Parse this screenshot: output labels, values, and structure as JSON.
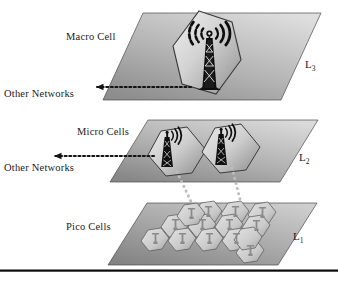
{
  "figure": {
    "type": "layered-network-diagram",
    "background_color": "#ffffff",
    "bottom_rule_color": "#0b0b0b"
  },
  "layers": [
    {
      "id": "L3",
      "layer_label": "L",
      "layer_subscript": "3",
      "cell_label": "Macro Cell",
      "other_networks_label": "Other Networks",
      "cell_count": 1,
      "has_other_networks_link": true,
      "plane_fill_top": "#d8d8d8",
      "plane_fill_bottom": "#8e8e8e",
      "cell_fill_light": "#e3e3e3",
      "cell_fill_dark": "#9a9a9a"
    },
    {
      "id": "L2",
      "layer_label": "L",
      "layer_subscript": "2",
      "cell_label": "Micro Cells",
      "other_networks_label": "Other Networks",
      "cell_count": 2,
      "has_other_networks_link": true,
      "plane_fill_top": "#d3d3d3",
      "plane_fill_bottom": "#8a8a8a",
      "cell_fill_light": "#e0e0e0",
      "cell_fill_dark": "#969696"
    },
    {
      "id": "L1",
      "layer_label": "L",
      "layer_subscript": "1",
      "cell_label": "Pico Cells",
      "other_networks_label": "",
      "cell_count": 14,
      "has_other_networks_link": false,
      "plane_fill_top": "#c9c9c9",
      "plane_fill_bottom": "#8a8a8a",
      "cell_fill_light": "#dcdcdc",
      "cell_fill_dark": "#a6a6a6"
    }
  ],
  "connectors": {
    "other_networks_arrow_color": "#151515",
    "interlayer_dot_color": "#b9b9b9",
    "interlayer_link_count": 2
  },
  "icons": {
    "macro_tower": "cell-tower-icon",
    "micro_tower": "cell-tower-icon",
    "pico_antenna": "small-antenna-icon",
    "signal_waves": "radio-waves-icon",
    "arrow": "arrow-left-icon"
  }
}
